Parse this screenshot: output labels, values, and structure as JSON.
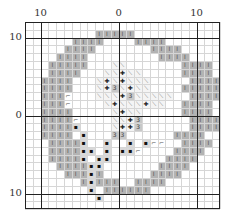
{
  "chart": {
    "type": "stitch-pattern-grid",
    "top_labels": [
      {
        "text": "10",
        "col": 2
      },
      {
        "text": "0",
        "col": 12
      },
      {
        "text": "10",
        "col": 22
      }
    ],
    "left_labels": [
      {
        "text": "10",
        "row": 2
      },
      {
        "text": "0",
        "row": 12
      },
      {
        "text": "10",
        "row": 22
      }
    ],
    "cols": 25,
    "rows": 24,
    "cell": 7.8,
    "axis_cols": [
      2,
      12,
      22
    ],
    "axis_rows": [
      2,
      12,
      22
    ],
    "symbols": {
      "I": {
        "glyph": "I",
        "bg": "#b3b3b3",
        "fg": "#555555",
        "name": "ring-stitch"
      },
      "\\": {
        "glyph": "⟍",
        "bg": "#f4f4f4",
        "fg": "#777777",
        "name": "diagonal-stitch"
      },
      "+": {
        "glyph": "✚",
        "bg": "#f4f4f4",
        "fg": "#222222",
        "name": "plus-stitch"
      },
      "3": {
        "glyph": "3",
        "bg": "#c8c8c8",
        "fg": "#444444",
        "name": "three-stitch"
      },
      "s": {
        "glyph": "▪",
        "bg": "#d9d9d9",
        "fg": "#111111",
        "name": "stem-stitch"
      },
      "r": {
        "glyph": "⌐",
        "bg": "#ffffff",
        "fg": "#555555",
        "name": "hook-stitch"
      }
    },
    "pattern": [
      ".........................",
      ".........IIIII...........",
      "......IIII....IIII.......",
      ".....IIII.......IIII.....",
      "....IIII.........IIII....",
      "...IIIII...\\\\.......IIII...",
      "...IIII...\\\\+\\\\.....IIII..",
      "..IIII...\\+\\+\\\\\\.....IIII..",
      "..IIII...\\+3\\+\\\\....IIIII.",
      "..IIIr...\\\\\\+3\\\\\\\\\\..IIII.",
      "..IIIr....\\+\\\\\\+\\\\..IIII.",
      "..IIII.....\\+\\\\.....IIII.",
      "..IIIIr....\\\\+3......IIII.",
      "..IIIIs....\\++3......IIII.",
      "..IIII.s...33......IIII..",
      "...IIIIs..s..s.srr..IIII..",
      "...IIIIss.s.ssr....IIII...",
      "...IIIIs.ss.......IIII....",
      "....IIIIss.......IIII.....",
      ".....IIIsI......IIII......",
      ".......IsIII..IIII........",
      "........s.IIIIII..........",
      ".........s................",
      "........................."
    ]
  }
}
